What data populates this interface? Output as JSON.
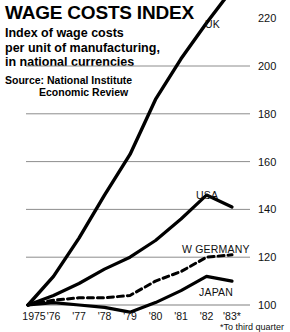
{
  "header": {
    "title": "WAGE COSTS INDEX",
    "subtitle_line1": "Index of wage costs",
    "subtitle_line2": "per unit of manufacturing,",
    "subtitle_line3": "in national currencies",
    "source_line1": "Source: National Institute",
    "source_line2": "Economic Review"
  },
  "footnote": "*To third quarter",
  "chart_data": {
    "type": "line",
    "title": "WAGE COSTS INDEX",
    "subtitle": "Index of wage costs per unit of manufacturing, in national currencies",
    "source": "Source: National Institute Economic Review",
    "xlabel": "",
    "ylabel": "",
    "x": [
      1975,
      1976,
      1977,
      1978,
      1979,
      1980,
      1981,
      1982,
      1983
    ],
    "categories": [
      "1975",
      "'76",
      "'77",
      "'78",
      "'79",
      "'80",
      "'81",
      "'82",
      "'83*"
    ],
    "ylim": [
      100,
      232
    ],
    "yticks": [
      100,
      120,
      140,
      160,
      180,
      200,
      220
    ],
    "ytick_labels": [
      "100",
      "120",
      "140",
      "160",
      "180",
      "200",
      "220"
    ],
    "grid": true,
    "grid_color": "#808080",
    "legend": "inline-labels",
    "note": "UK series rises above the plotted axis range at the right edge",
    "series": [
      {
        "name": "UK",
        "label": "UK",
        "style": "solid",
        "color": "#000000",
        "width": 3.4,
        "values": [
          100,
          112,
          128,
          146,
          163,
          186,
          203,
          218,
          232
        ]
      },
      {
        "name": "USA",
        "label": "USA",
        "style": "solid",
        "color": "#000000",
        "width": 3.2,
        "values": [
          100,
          104,
          109,
          115,
          120,
          127,
          136,
          146,
          141
        ]
      },
      {
        "name": "W GERMANY",
        "label": "W GERMANY",
        "style": "dashed",
        "color": "#000000",
        "width": 3.0,
        "values": [
          100,
          102,
          103,
          103,
          104,
          110,
          114,
          120,
          121
        ]
      },
      {
        "name": "JAPAN",
        "label": "JAPAN",
        "style": "solid",
        "color": "#000000",
        "width": 3.2,
        "values": [
          100,
          101,
          100,
          99,
          97,
          101,
          106,
          112,
          110
        ]
      }
    ],
    "series_label_positions": [
      {
        "name": "UK",
        "x": 205,
        "y": 18
      },
      {
        "name": "USA",
        "x": 196,
        "y": 189
      },
      {
        "name": "W GERMANY",
        "x": 182,
        "y": 243
      },
      {
        "name": "JAPAN",
        "x": 199,
        "y": 286
      }
    ]
  }
}
